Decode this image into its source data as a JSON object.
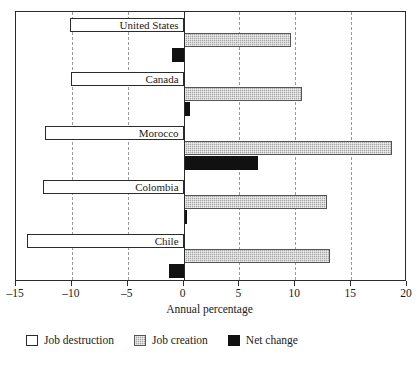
{
  "chart_data": {
    "type": "bar",
    "orientation": "horizontal",
    "title": "",
    "xlabel": "Annual percentage",
    "ylabel": "",
    "xlim": [
      -15,
      20
    ],
    "xticks": [
      -15,
      -10,
      -5,
      0,
      5,
      10,
      15,
      20
    ],
    "xticklabels": [
      "–15",
      "–10",
      "–5",
      "0",
      "5",
      "10",
      "15",
      "20"
    ],
    "grid": true,
    "grid_axis": "x",
    "grid_style": "dashed",
    "legend_position": "bottom",
    "categories": [
      "United States",
      "Canada",
      "Morocco",
      "Colombia",
      "Chile"
    ],
    "series": [
      {
        "name": "Job destruction",
        "color": "#ffffff",
        "edge_color": "#2b2b2b",
        "values": [
          -10.2,
          -10.1,
          -12.4,
          -12.6,
          -14.0
        ]
      },
      {
        "name": "Job creation",
        "color": "#a6a6a6",
        "edge_color": "#555555",
        "values": [
          9.6,
          10.6,
          18.7,
          12.8,
          13.1
        ]
      },
      {
        "name": "Net change",
        "color": "#111111",
        "edge_color": "#111111",
        "values": [
          -1.0,
          0.6,
          6.7,
          0.3,
          -1.3
        ]
      }
    ]
  },
  "axis": {
    "title": "Annual percentage"
  },
  "legend": {
    "items": [
      {
        "label": "Job destruction",
        "key": "destruction"
      },
      {
        "label": "Job creation",
        "key": "creation"
      },
      {
        "label": "Net change",
        "key": "net"
      }
    ]
  }
}
